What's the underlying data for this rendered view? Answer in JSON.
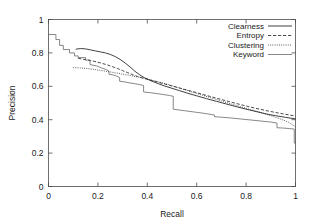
{
  "chart_data": {
    "type": "line",
    "title": "",
    "subtitle": "",
    "xlabel": "Recall",
    "ylabel": "Precision",
    "xlim": [
      0,
      1
    ],
    "ylim": [
      0,
      1
    ],
    "xticks": [
      "0",
      "0.2",
      "0.4",
      "0.6",
      "0.8",
      "1"
    ],
    "xtick_values": [
      0,
      0.2,
      0.4,
      0.6,
      0.8,
      1
    ],
    "yticks": [
      "0",
      "0.2",
      "0.4",
      "0.6",
      "0.8",
      "1"
    ],
    "ytick_values": [
      0,
      0.2,
      0.4,
      0.6,
      0.8,
      1
    ],
    "grid": false,
    "legend_position": "top-right",
    "legend_entries": [
      {
        "name": "Clearness",
        "style": "solid"
      },
      {
        "name": "Entropy",
        "style": "dashed"
      },
      {
        "name": "Clustering",
        "style": "dotted"
      },
      {
        "name": "Keyword",
        "style": "solid-thin"
      }
    ],
    "series": [
      {
        "name": "Clearness",
        "style": "solid",
        "points": [
          [
            0.11,
            0.822
          ],
          [
            0.13,
            0.826
          ],
          [
            0.15,
            0.824
          ],
          [
            0.17,
            0.818
          ],
          [
            0.19,
            0.812
          ],
          [
            0.21,
            0.806
          ],
          [
            0.23,
            0.8
          ],
          [
            0.25,
            0.791
          ],
          [
            0.27,
            0.778
          ],
          [
            0.29,
            0.761
          ],
          [
            0.31,
            0.74
          ],
          [
            0.33,
            0.716
          ],
          [
            0.35,
            0.69
          ],
          [
            0.37,
            0.668
          ],
          [
            0.39,
            0.65
          ],
          [
            0.41,
            0.636
          ],
          [
            0.44,
            0.618
          ],
          [
            0.47,
            0.602
          ],
          [
            0.5,
            0.588
          ],
          [
            0.53,
            0.574
          ],
          [
            0.56,
            0.56
          ],
          [
            0.6,
            0.543
          ],
          [
            0.64,
            0.526
          ],
          [
            0.68,
            0.51
          ],
          [
            0.72,
            0.494
          ],
          [
            0.76,
            0.478
          ],
          [
            0.8,
            0.463
          ],
          [
            0.84,
            0.449
          ],
          [
            0.88,
            0.435
          ],
          [
            0.92,
            0.424
          ],
          [
            0.96,
            0.414
          ],
          [
            1.0,
            0.405
          ]
        ]
      },
      {
        "name": "Entropy",
        "style": "dashed",
        "points": [
          [
            0.12,
            0.768
          ],
          [
            0.14,
            0.762
          ],
          [
            0.16,
            0.757
          ],
          [
            0.18,
            0.751
          ],
          [
            0.2,
            0.744
          ],
          [
            0.22,
            0.736
          ],
          [
            0.24,
            0.727
          ],
          [
            0.26,
            0.717
          ],
          [
            0.28,
            0.706
          ],
          [
            0.3,
            0.694
          ],
          [
            0.32,
            0.682
          ],
          [
            0.34,
            0.67
          ],
          [
            0.36,
            0.659
          ],
          [
            0.38,
            0.65
          ],
          [
            0.4,
            0.642
          ],
          [
            0.43,
            0.63
          ],
          [
            0.46,
            0.618
          ],
          [
            0.49,
            0.606
          ],
          [
            0.52,
            0.594
          ],
          [
            0.56,
            0.578
          ],
          [
            0.6,
            0.562
          ],
          [
            0.64,
            0.545
          ],
          [
            0.68,
            0.529
          ],
          [
            0.72,
            0.513
          ],
          [
            0.76,
            0.497
          ],
          [
            0.8,
            0.482
          ],
          [
            0.84,
            0.468
          ],
          [
            0.88,
            0.455
          ],
          [
            0.92,
            0.443
          ],
          [
            0.96,
            0.432
          ],
          [
            1.0,
            0.422
          ]
        ]
      },
      {
        "name": "Clustering",
        "style": "dotted",
        "points": [
          [
            0.1,
            0.712
          ],
          [
            0.13,
            0.71
          ],
          [
            0.16,
            0.706
          ],
          [
            0.19,
            0.7
          ],
          [
            0.22,
            0.693
          ],
          [
            0.25,
            0.686
          ],
          [
            0.28,
            0.678
          ],
          [
            0.31,
            0.67
          ],
          [
            0.34,
            0.662
          ],
          [
            0.37,
            0.653
          ],
          [
            0.4,
            0.644
          ],
          [
            0.43,
            0.633
          ],
          [
            0.46,
            0.621
          ],
          [
            0.49,
            0.608
          ],
          [
            0.52,
            0.594
          ],
          [
            0.55,
            0.58
          ],
          [
            0.58,
            0.566
          ],
          [
            0.62,
            0.548
          ],
          [
            0.66,
            0.53
          ],
          [
            0.7,
            0.512
          ],
          [
            0.74,
            0.494
          ],
          [
            0.78,
            0.477
          ],
          [
            0.82,
            0.46
          ],
          [
            0.86,
            0.443
          ],
          [
            0.9,
            0.424
          ],
          [
            0.94,
            0.404
          ],
          [
            0.97,
            0.386
          ],
          [
            1.0,
            0.358
          ]
        ]
      },
      {
        "name": "Keyword",
        "style": "solid-thin",
        "points": [
          [
            0.0,
            0.91
          ],
          [
            0.03,
            0.91
          ],
          [
            0.03,
            0.88
          ],
          [
            0.045,
            0.88
          ],
          [
            0.045,
            0.845
          ],
          [
            0.06,
            0.845
          ],
          [
            0.06,
            0.82
          ],
          [
            0.085,
            0.82
          ],
          [
            0.085,
            0.8
          ],
          [
            0.105,
            0.8
          ],
          [
            0.105,
            0.782
          ],
          [
            0.12,
            0.782
          ],
          [
            0.12,
            0.772
          ],
          [
            0.15,
            0.772
          ],
          [
            0.15,
            0.757
          ],
          [
            0.168,
            0.757
          ],
          [
            0.168,
            0.73
          ],
          [
            0.195,
            0.722
          ],
          [
            0.215,
            0.71
          ],
          [
            0.235,
            0.7
          ],
          [
            0.245,
            0.69
          ],
          [
            0.245,
            0.672
          ],
          [
            0.262,
            0.668
          ],
          [
            0.278,
            0.66
          ],
          [
            0.288,
            0.652
          ],
          [
            0.288,
            0.63
          ],
          [
            0.31,
            0.626
          ],
          [
            0.33,
            0.62
          ],
          [
            0.352,
            0.615
          ],
          [
            0.37,
            0.61
          ],
          [
            0.385,
            0.605
          ],
          [
            0.385,
            0.566
          ],
          [
            0.41,
            0.562
          ],
          [
            0.44,
            0.556
          ],
          [
            0.468,
            0.55
          ],
          [
            0.49,
            0.545
          ],
          [
            0.505,
            0.54
          ],
          [
            0.505,
            0.463
          ],
          [
            0.53,
            0.458
          ],
          [
            0.56,
            0.452
          ],
          [
            0.6,
            0.444
          ],
          [
            0.64,
            0.436
          ],
          [
            0.672,
            0.428
          ],
          [
            0.672,
            0.418
          ],
          [
            0.7,
            0.415
          ],
          [
            0.74,
            0.41
          ],
          [
            0.78,
            0.404
          ],
          [
            0.82,
            0.398
          ],
          [
            0.86,
            0.392
          ],
          [
            0.9,
            0.386
          ],
          [
            0.925,
            0.38
          ],
          [
            0.925,
            0.352
          ],
          [
            0.95,
            0.35
          ],
          [
            0.975,
            0.347
          ],
          [
            0.995,
            0.344
          ],
          [
            0.995,
            0.26
          ],
          [
            1.0,
            0.258
          ]
        ]
      }
    ]
  }
}
